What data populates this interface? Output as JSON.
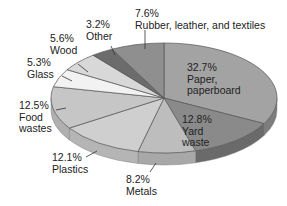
{
  "chart_data": {
    "type": "pie",
    "title": "",
    "style": "3d-tilted",
    "start_angle": "12 o'clock, clockwise",
    "categories": [
      "Paper, paperboard",
      "Yard waste",
      "Metals",
      "Plastics",
      "Food wastes",
      "Glass",
      "Wood",
      "Other",
      "Rubber, leather, and textiles"
    ],
    "values": [
      32.7,
      12.8,
      8.2,
      12.1,
      12.5,
      5.3,
      5.6,
      3.2,
      7.6
    ],
    "unit": "%",
    "colors": [
      "#a3a3a3",
      "#8a8a8a",
      "#bdbdbd",
      "#cfcfcf",
      "#c6c6c6",
      "#f2f2f2",
      "#d8d8d8",
      "#6c6c6c",
      "#8f8f8f"
    ],
    "side_colors": [
      "#7d7d7d",
      "#6a6a6a",
      "#a8a8a8",
      "#b5b5b5",
      "#b0b0b0",
      "#dedede",
      "#c2c2c2",
      "#555555",
      "#727272"
    ]
  },
  "labels": [
    {
      "pct": "32.7%",
      "name": "Paper,",
      "name2": "paperboard"
    },
    {
      "pct": "12.8%",
      "name": "Yard",
      "name2": "waste"
    },
    {
      "pct": "8.2%",
      "name": "Metals",
      "name2": ""
    },
    {
      "pct": "12.1%",
      "name": "Plastics",
      "name2": ""
    },
    {
      "pct": "12.5%",
      "name": "Food",
      "name2": "wastes"
    },
    {
      "pct": "5.3%",
      "name": "Glass",
      "name2": ""
    },
    {
      "pct": "5.6%",
      "name": "Wood",
      "name2": ""
    },
    {
      "pct": "3.2%",
      "name": "Other",
      "name2": ""
    },
    {
      "pct": "7.6%",
      "name": "Rubber, leather, and textiles",
      "name2": ""
    }
  ]
}
